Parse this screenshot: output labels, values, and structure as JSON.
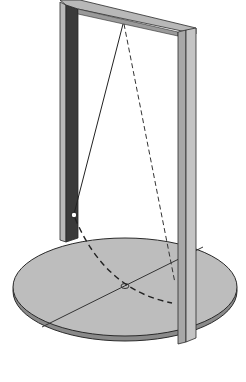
{
  "diagram": {
    "colors": {
      "background": "#ffffff",
      "frame_light": "#b8b8b8",
      "frame_dark": "#3a3a3a",
      "base_fill": "#bdbdbd",
      "outline": "#2a2a2a",
      "string": "#222222"
    },
    "elements": [
      {
        "name": "frame-left-post"
      },
      {
        "name": "frame-top-beam"
      },
      {
        "name": "frame-right-post"
      },
      {
        "name": "circular-base"
      },
      {
        "name": "pendulum-string-current"
      },
      {
        "name": "pendulum-string-ghost-dashed"
      },
      {
        "name": "pendulum-bob"
      },
      {
        "name": "swing-arc-dashed"
      },
      {
        "name": "base-center-mark"
      },
      {
        "name": "base-reference-line"
      }
    ]
  }
}
